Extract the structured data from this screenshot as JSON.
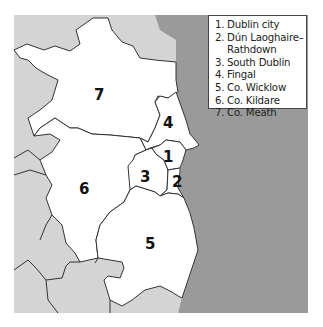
{
  "map": {
    "colors": {
      "sea": "#9a9a9a",
      "other_land": "#d4d4d4",
      "highlighted_region": "#ffffff",
      "border": "#333333"
    },
    "regions": [
      {
        "number": "1",
        "name": "Dublin city"
      },
      {
        "number": "2",
        "name": "Dún Laoghaire–Rathdown"
      },
      {
        "number": "3",
        "name": "South Dublin"
      },
      {
        "number": "4",
        "name": "Fingal"
      },
      {
        "number": "5",
        "name": "Co. Wicklow"
      },
      {
        "number": "6",
        "name": "Co. Kildare"
      },
      {
        "number": "7",
        "name": "Co. Meath"
      }
    ]
  },
  "legend": {
    "items": [
      {
        "num": "1.",
        "text": "Dublin city"
      },
      {
        "num": "2.",
        "text": "Dún Laoghaire–"
      },
      {
        "num": "",
        "text": "Rathdown"
      },
      {
        "num": "3.",
        "text": "South Dublin"
      },
      {
        "num": "4.",
        "text": "Fingal"
      },
      {
        "num": "5.",
        "text": "Co. Wicklow"
      },
      {
        "num": "6.",
        "text": "Co. Kildare"
      },
      {
        "num": "7.",
        "text": "Co. Meath"
      }
    ]
  }
}
